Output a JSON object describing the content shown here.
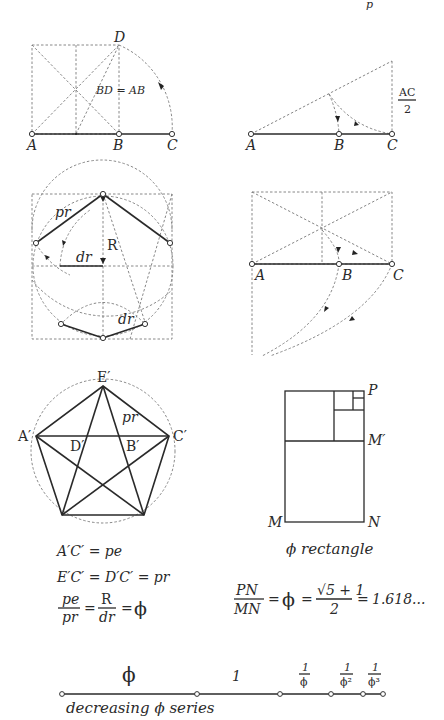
{
  "page": {
    "header_mark": "p"
  },
  "panels": {
    "square_construction": {
      "labels": {
        "A": "A",
        "B": "B",
        "C": "C",
        "D": "D"
      },
      "equation": "BD = AB"
    },
    "triangle_construction": {
      "labels": {
        "A": "A",
        "B": "B",
        "C": "C"
      },
      "fraction_num": "AC",
      "fraction_den": "2"
    },
    "pentagon_construction": {
      "labels": {
        "pr": "pr",
        "R": "R",
        "dr_top": "dr",
        "dr_bottom": "dr"
      }
    },
    "rectangle_extension": {
      "labels": {
        "A": "A",
        "B": "B",
        "C": "C"
      }
    },
    "pentagram": {
      "labels": {
        "E": "E′",
        "A": "A′",
        "C": "C′",
        "D": "D′",
        "B": "B′",
        "pr": "pr"
      },
      "formulas": {
        "line1": "A′C′ = pe",
        "line2": "E′C′ = D′C′ = pr",
        "f3_num1": "pe",
        "f3_den1": "pr",
        "f3_eq1": "=",
        "f3_num2": "R",
        "f3_den2": "dr",
        "f3_eq2": "=",
        "f3_phi": "ϕ"
      }
    },
    "phi_rectangle": {
      "labels": {
        "P": "P",
        "M_prime": "M′",
        "M": "M",
        "N": "N"
      },
      "caption": "ϕ rectangle",
      "formula": {
        "num1": "PN",
        "den1": "MN",
        "eq1": "=",
        "phi": "ϕ",
        "eq2": "=",
        "num2": "√5 + 1",
        "den2": "2",
        "eq3": "=",
        "value": "1.618..."
      }
    },
    "phi_series": {
      "segments": [
        {
          "label": "ϕ"
        },
        {
          "label": "1"
        },
        {
          "num": "1",
          "den": "ϕ"
        },
        {
          "num": "1",
          "den": "ϕ²"
        },
        {
          "num": "1",
          "den": "ϕ³"
        }
      ],
      "caption": "decreasing ϕ series"
    }
  }
}
